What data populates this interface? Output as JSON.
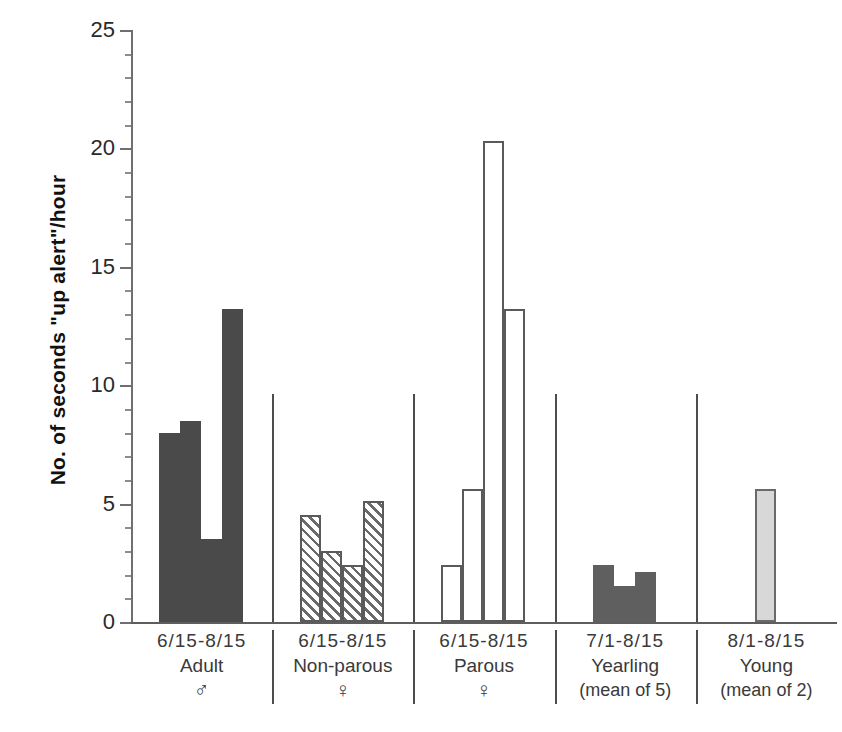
{
  "chart_data": {
    "type": "bar",
    "title": "",
    "xlabel": "",
    "ylabel": "No. of seconds \"up alert\"/hour",
    "ylim": [
      0,
      25
    ],
    "yticks": [
      0,
      5,
      10,
      15,
      20,
      25
    ],
    "ytick_labels": [
      "0",
      "5",
      "10",
      "15",
      "20",
      "25"
    ],
    "minor_tick_step": 1,
    "grid": false,
    "legend": "none",
    "groups": [
      {
        "name": "Adult",
        "dates": "6/15-8/15",
        "sex": "♂",
        "sub": "",
        "fill": "solid-dark",
        "values": [
          8.0,
          8.5,
          3.5,
          13.2
        ]
      },
      {
        "name": "Non-parous",
        "dates": "6/15-8/15",
        "sex": "♀",
        "sub": "",
        "fill": "hatch",
        "values": [
          4.5,
          3.0,
          2.4,
          5.1
        ]
      },
      {
        "name": "Parous",
        "dates": "6/15-8/15",
        "sex": "♀",
        "sub": "",
        "fill": "open",
        "values": [
          2.4,
          5.6,
          20.3,
          13.2
        ]
      },
      {
        "name": "Yearling",
        "dates": "7/1-8/15",
        "sex": "",
        "sub": "(mean of 5)",
        "fill": "mid-gray",
        "values": [
          2.4,
          1.5,
          2.1
        ]
      },
      {
        "name": "Young",
        "dates": "8/1-8/15",
        "sex": "",
        "sub": "(mean of 2)",
        "fill": "light-gray",
        "values": [
          5.6
        ]
      }
    ]
  },
  "colors": {
    "solid_dark": "#4a4a4a",
    "mid_gray": "#5f5f5f",
    "light_gray": "#d8d8d8",
    "outline": "#5a5a5a",
    "axis": "#6f6f6f"
  }
}
